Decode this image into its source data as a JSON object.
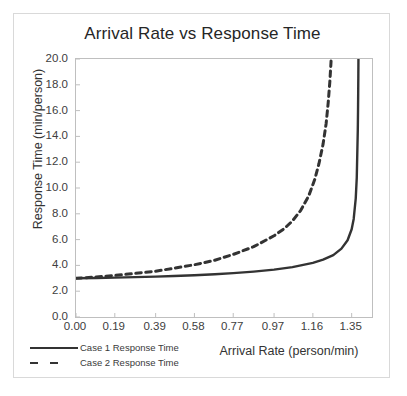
{
  "chart_data": {
    "type": "line",
    "title": "Arrival Rate vs Response Time",
    "xlabel": "Arrival Rate (person/min)",
    "ylabel": "Response Time (min/person)",
    "xlim": [
      0.0,
      1.4496
    ],
    "ylim": [
      0.0,
      20.0
    ],
    "grid": false,
    "legend_position": "bottom-left",
    "x_ticks": [
      "0.00",
      "0.19",
      "0.39",
      "0.58",
      "0.77",
      "0.97",
      "1.16",
      "1.35"
    ],
    "x_tick_values": [
      0.0,
      0.19,
      0.39,
      0.58,
      0.77,
      0.97,
      1.16,
      1.35
    ],
    "y_ticks": [
      "0.0",
      "2.0",
      "4.0",
      "6.0",
      "8.0",
      "10.0",
      "12.0",
      "14.0",
      "16.0",
      "18.0",
      "20.0"
    ],
    "y_tick_values": [
      0.0,
      2.0,
      4.0,
      6.0,
      8.0,
      10.0,
      12.0,
      14.0,
      16.0,
      18.0,
      20.0
    ],
    "series": [
      {
        "name": "Case 1 Response Time",
        "style": "solid",
        "color": "#333333",
        "asymptote_x": 1.39,
        "x": [
          0.0,
          0.1,
          0.19,
          0.29,
          0.39,
          0.48,
          0.58,
          0.68,
          0.77,
          0.87,
          0.97,
          1.06,
          1.16,
          1.21,
          1.26,
          1.3,
          1.33,
          1.35,
          1.36,
          1.37,
          1.375,
          1.38
        ],
        "y": [
          3.0,
          3.02,
          3.05,
          3.09,
          3.13,
          3.18,
          3.24,
          3.31,
          3.4,
          3.52,
          3.67,
          3.87,
          4.2,
          4.45,
          4.8,
          5.3,
          5.95,
          6.8,
          7.6,
          9.2,
          10.8,
          14.5
        ]
      },
      {
        "name": "Case 2 Response Time",
        "style": "dashed",
        "color": "#333333",
        "asymptote_x": 1.262,
        "x": [
          0.0,
          0.1,
          0.19,
          0.29,
          0.39,
          0.48,
          0.58,
          0.68,
          0.77,
          0.87,
          0.97,
          1.02,
          1.06,
          1.1,
          1.14,
          1.17,
          1.19,
          1.21,
          1.225,
          1.235,
          1.243,
          1.249
        ],
        "y": [
          3.0,
          3.1,
          3.22,
          3.38,
          3.55,
          3.78,
          4.05,
          4.4,
          4.85,
          5.45,
          6.3,
          6.85,
          7.45,
          8.25,
          9.4,
          10.7,
          11.9,
          13.4,
          15.0,
          16.6,
          18.2,
          19.8
        ]
      }
    ]
  },
  "legend": {
    "items": [
      {
        "label": "Case 1 Response Time",
        "style": "solid"
      },
      {
        "label": "Case 2 Response Time",
        "style": "dashed"
      }
    ]
  }
}
